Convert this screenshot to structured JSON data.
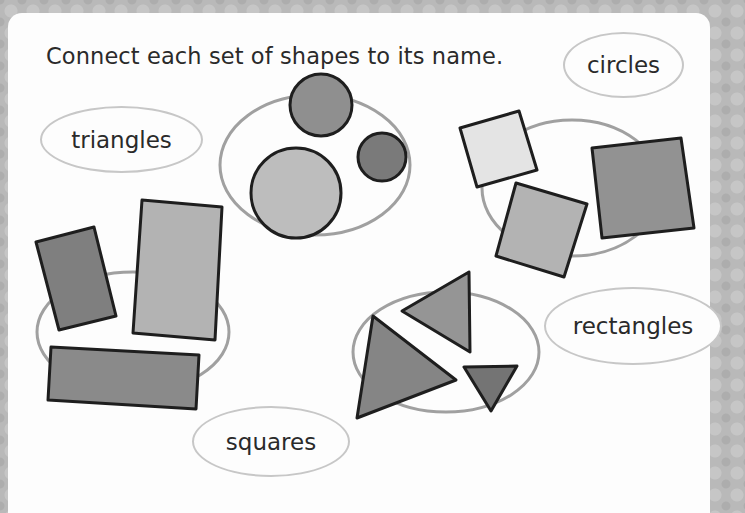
{
  "worksheet": {
    "instruction": "Connect each set of shapes to its name.",
    "labels": [
      {
        "id": "circles",
        "text": "circles"
      },
      {
        "id": "triangles",
        "text": "triangles"
      },
      {
        "id": "rectangles",
        "text": "rectangles"
      },
      {
        "id": "squares",
        "text": "squares"
      }
    ],
    "shape_groups": [
      {
        "name": "circle-group",
        "count": 3
      },
      {
        "name": "square-group",
        "count": 3
      },
      {
        "name": "rectangle-group",
        "count": 3
      },
      {
        "name": "triangle-group",
        "count": 3
      }
    ],
    "colors": {
      "panel": "#fdfdfd",
      "border_bg": "#b9b9b9",
      "ellipse_stroke": "#a0a0a0",
      "label_stroke": "#c7c7c7",
      "shape_outline": "#1e1e1e",
      "fill_dark": "#808080",
      "fill_mid": "#9a9a9a",
      "fill_light": "#bdbdbd",
      "fill_pale": "#e4e4e4",
      "text": "#2a2a2a"
    }
  }
}
